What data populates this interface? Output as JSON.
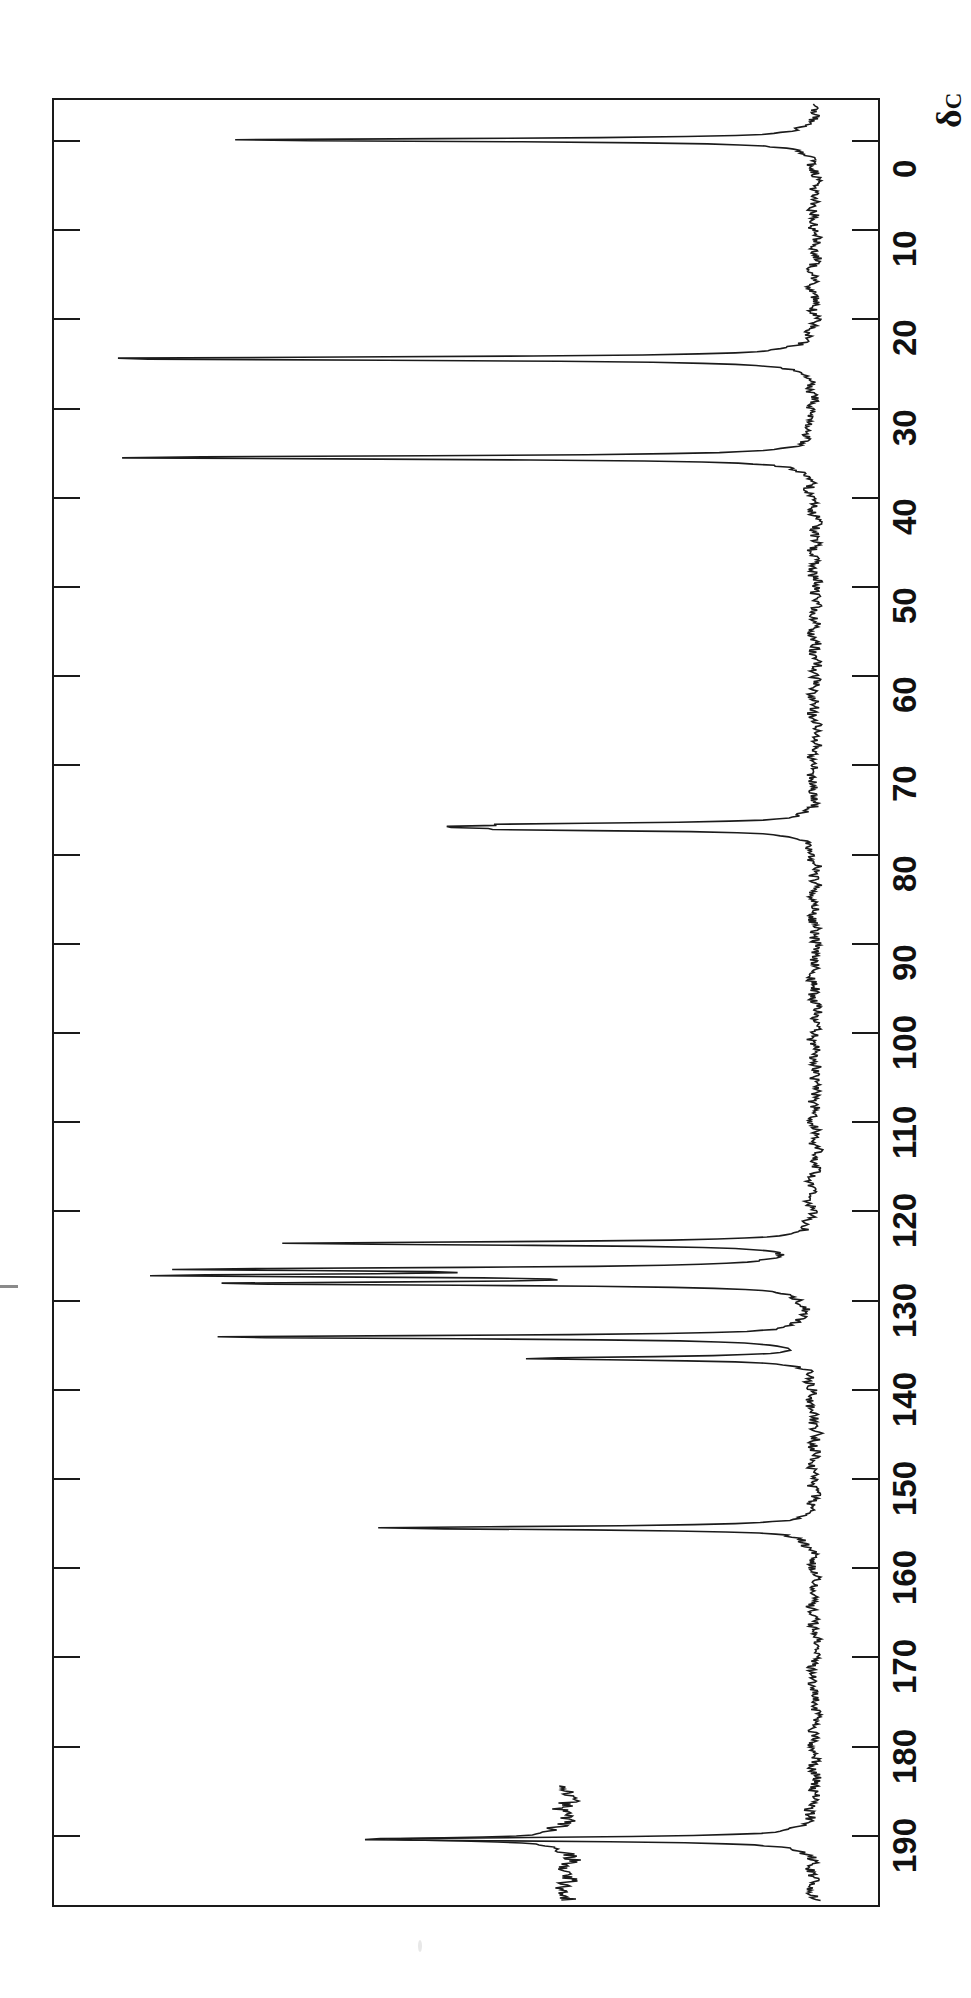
{
  "figure": {
    "kind": "nmr-spectrum",
    "nucleus": "13C",
    "orientation": "rotated-90",
    "axis_caption": "δ",
    "axis_caption_sub": "C"
  },
  "axis": {
    "label": "δc",
    "unit": "ppm",
    "direction": "0-at-top",
    "range": [
      -3,
      197
    ],
    "tick_interval": 10,
    "ticks": [
      {
        "value": 0,
        "label": "0"
      },
      {
        "value": 10,
        "label": "10"
      },
      {
        "value": 20,
        "label": "20"
      },
      {
        "value": 30,
        "label": "30"
      },
      {
        "value": 40,
        "label": "40"
      },
      {
        "value": 50,
        "label": "50"
      },
      {
        "value": 60,
        "label": "60"
      },
      {
        "value": 70,
        "label": "70"
      },
      {
        "value": 80,
        "label": "80"
      },
      {
        "value": 90,
        "label": "90"
      },
      {
        "value": 100,
        "label": "100"
      },
      {
        "value": 110,
        "label": "110"
      },
      {
        "value": 120,
        "label": "120"
      },
      {
        "value": 130,
        "label": "130"
      },
      {
        "value": 140,
        "label": "140"
      },
      {
        "value": 150,
        "label": "150"
      },
      {
        "value": 160,
        "label": "160"
      },
      {
        "value": 170,
        "label": "170"
      },
      {
        "value": 180,
        "label": "180"
      },
      {
        "value": 190,
        "label": "190"
      }
    ]
  },
  "chart_data": {
    "type": "line",
    "title": "",
    "subtitle": "",
    "xlabel": "δc",
    "ylabel": "",
    "xlim": [
      -3,
      197
    ],
    "grid": false,
    "legend": null,
    "annotations": [],
    "series": [
      {
        "name": "main-spectrum",
        "peaks": [
          {
            "shift": 0.0,
            "intensity": 0.78,
            "assignment": "TMS reference"
          },
          {
            "shift": 24.5,
            "intensity": 0.96,
            "assignment": "CH2"
          },
          {
            "shift": 35.6,
            "intensity": 0.93,
            "assignment": "CH2"
          },
          {
            "shift": 76.7,
            "intensity": 0.29,
            "assignment": "CDCl3"
          },
          {
            "shift": 77.0,
            "intensity": 0.33,
            "assignment": "CDCl3"
          },
          {
            "shift": 77.3,
            "intensity": 0.3,
            "assignment": "CDCl3"
          },
          {
            "shift": 123.7,
            "intensity": 0.69,
            "assignment": "aromatic CH"
          },
          {
            "shift": 126.6,
            "intensity": 0.76,
            "assignment": "aromatic CH"
          },
          {
            "shift": 127.3,
            "intensity": 0.77,
            "assignment": "aromatic CH"
          },
          {
            "shift": 128.2,
            "intensity": 0.74,
            "assignment": "aromatic CH"
          },
          {
            "shift": 134.2,
            "intensity": 0.8,
            "assignment": "aromatic C"
          },
          {
            "shift": 136.6,
            "intensity": 0.38,
            "assignment": "aromatic C"
          },
          {
            "shift": 155.6,
            "intensity": 0.58,
            "assignment": "quaternary C-O"
          },
          {
            "shift": 190.5,
            "intensity": 0.62,
            "assignment": "C=O"
          }
        ]
      },
      {
        "name": "vertical-expansion-inset",
        "peaks": [
          {
            "shift": 190.5,
            "intensity": 1.0,
            "assignment": "C=O expanded"
          }
        ]
      }
    ]
  }
}
